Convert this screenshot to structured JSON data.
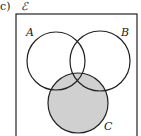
{
  "diagram": {
    "part_label": "c)",
    "universal_label": "ℰ",
    "sets": [
      {
        "name": "A",
        "shaded": false
      },
      {
        "name": "B",
        "shaded": false
      },
      {
        "name": "C",
        "shaded": true
      }
    ],
    "shade_color": "#d0d0d0",
    "stroke_color": "#222222"
  }
}
